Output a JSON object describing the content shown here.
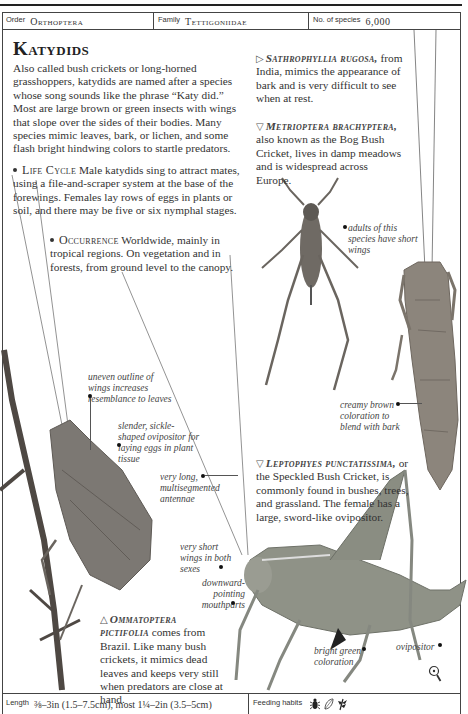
{
  "header": {
    "order_label": "Order",
    "order_value": "Orthoptera",
    "family_label": "Family",
    "family_value": "Tettigoniidae",
    "species_label": "No. of species",
    "species_value": "6,000"
  },
  "title": "Katydids",
  "intro": "Also called bush crickets or long-horned grasshoppers, katydids are named after a species whose song sounds like the phrase “Katy did.” Most are large brown or green insects with wings that slope over the sides of their bodies. Many species mimic leaves, bark, or lichen, and some flash bright hindwing colors to startle predators.",
  "life_cycle": {
    "heading": "Life Cycle",
    "text": "Male katydids sing to attract mates, using a file-and-scraper system at the base of the forewings. Females lay rows of eggs in plants or soil, and there may be five or six nymphal stages."
  },
  "occurrence": {
    "heading": "Occurrence",
    "text": "Worldwide, mainly in tropical regions. On vegetation and in forests, from ground level to the canopy."
  },
  "species": [
    {
      "arrow": "▷",
      "name": "Sathrophyllia rugosa,",
      "text": "from India, mimics the appearance of bark and is very difficult to see when at rest."
    },
    {
      "arrow": "▽",
      "name": "Metrioptera brachyptera,",
      "text": "also known as the Bog Bush Cricket, lives in damp meadows and is widespread across Europe."
    },
    {
      "arrow": "▽",
      "name": "Leptophyes punctatissima,",
      "text": "or the Speckled Bush Cricket, is commonly found in bushes, trees, and grassland. The female has a large, sword-like ovipositor."
    },
    {
      "arrow": "△",
      "name": "Ommatoptera pictifolia",
      "text": "comes from Brazil. Like many bush crickets, it mimics dead leaves and keeps very still when predators are close at hand."
    }
  ],
  "annotations": {
    "short_wings": "adults of this species have short wings",
    "creamy_brown": "creamy brown coloration to blend with bark",
    "uneven_outline": "uneven outline of wings increases resemblance to leaves",
    "sickle_ovipositor": "slender, sickle-shaped ovipositor for laying eggs in plant tissue",
    "long_antennae": "very long, multisegmented antennae",
    "very_short_wings": "very short wings in both sexes",
    "mouthparts": "downward-pointing mouthparts",
    "bright_green": "bright green coloration",
    "ovipositor": "ovipositor"
  },
  "footer": {
    "length_label": "Length",
    "length_value": "⅜–3in (1.5–7.5cm), most 1¼–2in (3.5–5cm)",
    "feeding_label": "Feeding habits",
    "feeding_icons": [
      "insect-icon",
      "leaf-icon",
      "plant-icon"
    ]
  }
}
